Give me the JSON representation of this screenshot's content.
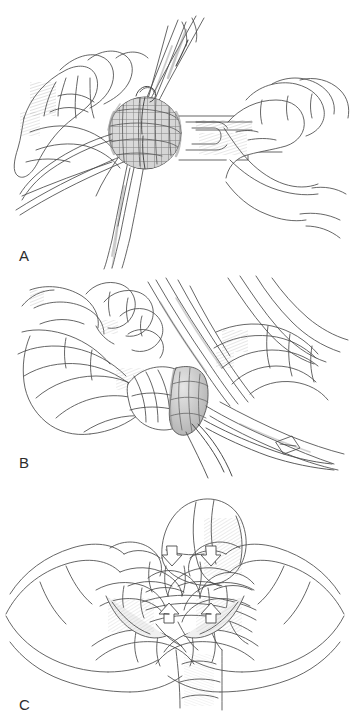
{
  "figure": {
    "style": "pen-and-ink line drawing",
    "background_color": "#ffffff",
    "ink_color": "#4a4a4a",
    "shade_color": "#8d8d8d",
    "panel_count": 3
  },
  "panels": [
    {
      "id": "A",
      "label": "A",
      "caption": "Mesh plug held in forceps being positioned into the defect while the surgeon's hand guides the applicator handle",
      "elements": [
        "left-hand-retracting-tissue",
        "mesh-plug",
        "long-forceps-shafts",
        "applicator-handle",
        "right-hand-gripping-handle",
        "suture-strands"
      ]
    },
    {
      "id": "B",
      "label": "B",
      "caption": "Surgeon's fingers seating the mesh plug in the inguinal ring with clamp and sutures held at the right",
      "elements": [
        "left-hand-fingers-pressing",
        "mesh-plug-seated",
        "instrument-shafts",
        "suture-strands-trailing",
        "anatomy-cord-structures"
      ]
    },
    {
      "id": "C",
      "label": "C",
      "caption": "Both hands with thumbs and index fingers compressing tissue toward the midline; arrows show direction of pressure",
      "elements": [
        "left-hand",
        "right-hand",
        "rounded-anatomic-structure",
        "tissue-flaps",
        "direction-arrows"
      ],
      "arrows": [
        {
          "name": "arrow-upper-left",
          "direction": "down",
          "x": 170,
          "y": 556
        },
        {
          "name": "arrow-upper-right",
          "direction": "down",
          "x": 209,
          "y": 556
        },
        {
          "name": "arrow-lower-left",
          "direction": "up",
          "x": 172,
          "y": 604
        },
        {
          "name": "arrow-lower-right",
          "direction": "up",
          "x": 209,
          "y": 604
        }
      ]
    }
  ],
  "labels": {
    "a": "A",
    "b": "B",
    "c": "C"
  }
}
